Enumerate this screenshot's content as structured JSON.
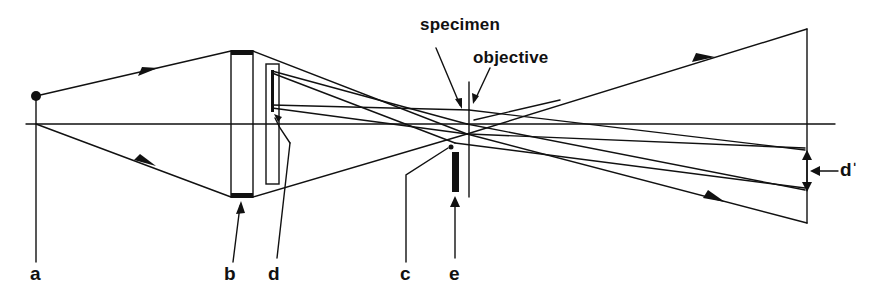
{
  "diagram": {
    "type": "optical ray diagram",
    "colors": {
      "line": "#111111",
      "background": "#ffffff"
    },
    "labels": {
      "a": "a",
      "b": "b",
      "d": "d",
      "c": "c",
      "e": "e",
      "d_prime": "dˈ",
      "specimen": "specimen",
      "objective": "objective"
    },
    "components": [
      {
        "id": "a",
        "name": "point source"
      },
      {
        "id": "b",
        "name": "condenser lens"
      },
      {
        "id": "d",
        "name": "object / slide"
      },
      {
        "id": "c",
        "name": "focal point"
      },
      {
        "id": "e",
        "name": "stop"
      },
      {
        "id": "specimen",
        "name": "specimen"
      },
      {
        "id": "objective",
        "name": "objective"
      },
      {
        "id": "d_prime",
        "name": "image size d'"
      }
    ]
  }
}
